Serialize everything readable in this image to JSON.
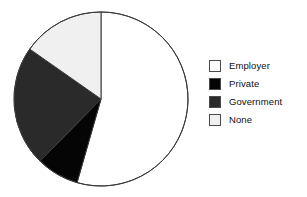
{
  "chart_data": {
    "type": "pie",
    "title": "",
    "subtitle": "",
    "xlabel": "",
    "ylabel": "",
    "grid": false,
    "legend_position": "right",
    "start_angle_deg": 0,
    "direction": "clockwise",
    "categories": [
      "Employer",
      "Private",
      "Government",
      "None"
    ],
    "values": [
      54.4,
      7.9,
      22.4,
      15.3
    ],
    "units": "percent",
    "slices": [
      {
        "label": "Employer",
        "value": 54.4,
        "start_angle_deg": 0,
        "end_angle_deg": 196,
        "color": "#ffffff",
        "edge_color": "#3a3a3a",
        "swatch_name": "legend-swatch-employer"
      },
      {
        "label": "Private",
        "value": 7.9,
        "start_angle_deg": 196,
        "end_angle_deg": 224.5,
        "color": "#050505",
        "edge_color": "#3a3a3a",
        "swatch_name": "legend-swatch-private"
      },
      {
        "label": "Government",
        "value": 22.4,
        "start_angle_deg": 224.5,
        "end_angle_deg": 305,
        "color": "#2a2a2a",
        "edge_color": "#3a3a3a",
        "swatch_name": "legend-swatch-government"
      },
      {
        "label": "None",
        "value": 15.3,
        "start_angle_deg": 305,
        "end_angle_deg": 360,
        "color": "#f0f0f0",
        "edge_color": "#3a3a3a",
        "swatch_name": "legend-swatch-none"
      }
    ]
  },
  "legend": {
    "entries": [
      {
        "label": "Employer",
        "color": "#ffffff"
      },
      {
        "label": "Private",
        "color": "#050505"
      },
      {
        "label": "Government",
        "color": "#2a2a2a"
      },
      {
        "label": "None",
        "color": "#f0f0f0"
      }
    ]
  },
  "colors": {
    "background": "#ffffff",
    "outline": "#3a3a3a",
    "text": "#101010",
    "swatch_border": "#4a4a4a"
  },
  "geometry": {
    "center_x": 101,
    "center_y": 99,
    "radius": 87
  }
}
